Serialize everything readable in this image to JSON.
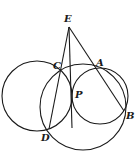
{
  "figure": {
    "type": "geometry",
    "stroke_color": "#1a1a1a",
    "background": "#ffffff"
  },
  "points": {
    "E": {
      "label": "E",
      "x": 69,
      "y": 27
    },
    "C": {
      "label": "C",
      "x": 59,
      "y": 70
    },
    "A": {
      "label": "A",
      "x": 95,
      "y": 67
    },
    "P": {
      "label": "P",
      "x": 72,
      "y": 95
    },
    "B": {
      "label": "B",
      "x": 124,
      "y": 111
    },
    "D": {
      "label": "D",
      "x": 49,
      "y": 129
    }
  },
  "labels": {
    "E": "E",
    "C": "C",
    "A": "A",
    "P": "P",
    "B": "B",
    "D": "D"
  },
  "circles": [
    {
      "name": "left-circle",
      "cx": 37,
      "cy": 96,
      "r": 35
    },
    {
      "name": "right-circle",
      "cx": 100,
      "cy": 96,
      "r": 28
    },
    {
      "name": "large-circle",
      "cx": 83,
      "cy": 107,
      "r": 43
    }
  ]
}
